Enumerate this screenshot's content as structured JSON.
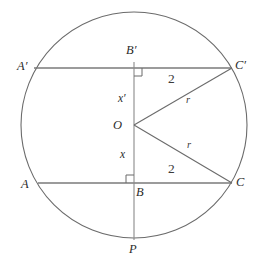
{
  "figure": {
    "kind": "euclidean-geometry-diagram",
    "stroke_color": "#6b6b6b",
    "label_color": "#2b2b2b",
    "background_color": "#ffffff"
  },
  "circle": {
    "name": "main-circle",
    "center_x": 134,
    "center_y": 125,
    "radius": 113
  },
  "points": {
    "O": {
      "label": "O",
      "x": 134,
      "y": 125,
      "text_x": 113,
      "text_y": 119
    },
    "P": {
      "label": "P",
      "x": 134,
      "y": 238,
      "text_x": 129,
      "text_y": 243
    },
    "A_upper": {
      "label": "A′",
      "x": 34,
      "y": 68,
      "text_x": 17,
      "text_y": 60
    },
    "B_upper": {
      "label": "B′",
      "x": 134,
      "y": 68,
      "text_x": 126,
      "text_y": 44
    },
    "C_upper": {
      "label": "C′",
      "x": 232,
      "y": 68,
      "text_x": 235,
      "text_y": 59
    },
    "A_lower": {
      "label": "A",
      "x": 38,
      "y": 183,
      "text_x": 21,
      "text_y": 178
    },
    "B_lower": {
      "label": "B",
      "x": 134,
      "y": 183,
      "text_x": 136,
      "text_y": 186
    },
    "C_lower": {
      "label": "C",
      "x": 232,
      "y": 183,
      "text_x": 236,
      "text_y": 176
    }
  },
  "segments": {
    "upper_chord": {
      "name": "chord-A-prime-C-prime",
      "x1": 34,
      "y1": 68,
      "x2": 232,
      "y2": 68
    },
    "lower_chord": {
      "name": "chord-A-C",
      "x1": 38,
      "y1": 183,
      "x2": 232,
      "y2": 183
    },
    "vertical_diameter": {
      "name": "perpendicular-bisector-through-O",
      "x1": 134,
      "y1": 62,
      "x2": 134,
      "y2": 240
    },
    "radius_upper": {
      "name": "radius-O-to-C-prime",
      "x1": 134,
      "y1": 125,
      "x2": 232,
      "y2": 68
    },
    "radius_lower": {
      "name": "radius-O-to-C",
      "x1": 134,
      "y1": 125,
      "x2": 232,
      "y2": 183
    }
  },
  "right_angles": {
    "upper": {
      "name": "right-angle-at-B-prime",
      "x": 134,
      "y": 68,
      "size": 8,
      "dir_x": 1,
      "dir_y": 1
    },
    "lower": {
      "name": "right-angle-at-B",
      "x": 134,
      "y": 183,
      "size": 8,
      "dir_x": -1,
      "dir_y": -1
    }
  },
  "measure_labels": {
    "upper_half_chord": {
      "text": "2",
      "x": 168,
      "y": 72,
      "describes": "length of B-prime to C-prime"
    },
    "lower_half_chord": {
      "text": "2",
      "x": 168,
      "y": 162,
      "describes": "length of B to C"
    },
    "radius_upper": {
      "text": "r",
      "x": 186,
      "y": 95,
      "describes": "radius O to C-prime"
    },
    "radius_lower": {
      "text": "r",
      "x": 187,
      "y": 140,
      "describes": "radius O to C"
    },
    "x_prime": {
      "text": "x′",
      "x": 118,
      "y": 93,
      "describes": "distance from O up to B-prime"
    },
    "x": {
      "text": "x",
      "x": 120,
      "y": 149,
      "describes": "distance from O down to B"
    }
  }
}
